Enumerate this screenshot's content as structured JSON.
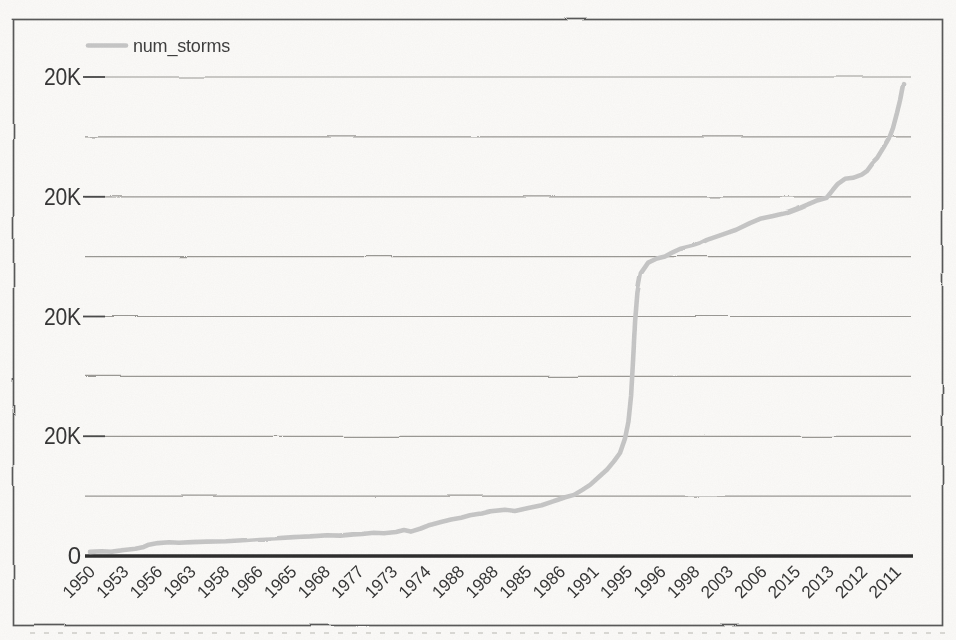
{
  "chart_data": {
    "type": "line",
    "title": "",
    "legend": {
      "position": "top-left",
      "entries": [
        {
          "label": "num_storms",
          "swatch": "thick-gray-line-segment"
        }
      ]
    },
    "x_axis": {
      "tick_labels": [
        "1950",
        "1953",
        "1956",
        "1963",
        "1958",
        "1966",
        "1965",
        "1968",
        "1977",
        "1973",
        "1974",
        "1988",
        "1988",
        "1985",
        "1986",
        "1991",
        "1995",
        "1996",
        "1998",
        "2003",
        "2006",
        "2015",
        "2013",
        "2012",
        "2011"
      ],
      "rotation_deg": -45
    },
    "y_axis": {
      "tick_labels_top_to_bottom": [
        "20K",
        "20K",
        "20K",
        "20K"
      ],
      "zero_label": "0",
      "note_as_printed": "every labeled gridline reads 20K",
      "internal_scale_top_gridline": 20,
      "minor_gridlines_between_labels": true
    },
    "grid": true,
    "series": [
      {
        "name": "num_storms",
        "points": [
          [
            0.15,
            0.17
          ],
          [
            0.5,
            0.2
          ],
          [
            0.8,
            0.18
          ],
          [
            1.16,
            0.25
          ],
          [
            1.5,
            0.3
          ],
          [
            1.75,
            0.38
          ],
          [
            1.9,
            0.47
          ],
          [
            2.17,
            0.54
          ],
          [
            2.5,
            0.57
          ],
          [
            2.8,
            0.55
          ],
          [
            3.19,
            0.58
          ],
          [
            3.6,
            0.6
          ],
          [
            4.2,
            0.62
          ],
          [
            4.7,
            0.66
          ],
          [
            5.21,
            0.71
          ],
          [
            5.7,
            0.74
          ],
          [
            6.22,
            0.79
          ],
          [
            6.7,
            0.82
          ],
          [
            7.24,
            0.87
          ],
          [
            7.6,
            0.85
          ],
          [
            8.0,
            0.9
          ],
          [
            8.25,
            0.92
          ],
          [
            8.6,
            0.97
          ],
          [
            8.9,
            0.95
          ],
          [
            9.26,
            1.0
          ],
          [
            9.5,
            1.08
          ],
          [
            9.7,
            1.02
          ],
          [
            10.0,
            1.15
          ],
          [
            10.27,
            1.3
          ],
          [
            10.6,
            1.42
          ],
          [
            10.9,
            1.52
          ],
          [
            11.2,
            1.6
          ],
          [
            11.46,
            1.7
          ],
          [
            11.79,
            1.78
          ],
          [
            12.06,
            1.87
          ],
          [
            12.5,
            1.93
          ],
          [
            12.8,
            1.88
          ],
          [
            13.2,
            2.0
          ],
          [
            13.6,
            2.12
          ],
          [
            14.06,
            2.34
          ],
          [
            14.3,
            2.45
          ],
          [
            14.56,
            2.55
          ],
          [
            14.8,
            2.75
          ],
          [
            15.04,
            2.97
          ],
          [
            15.3,
            3.3
          ],
          [
            15.54,
            3.6
          ],
          [
            15.75,
            3.95
          ],
          [
            15.93,
            4.3
          ],
          [
            16.08,
            4.9
          ],
          [
            16.18,
            5.6
          ],
          [
            16.26,
            6.7
          ],
          [
            16.32,
            8.2
          ],
          [
            16.38,
            9.8
          ],
          [
            16.45,
            11.0
          ],
          [
            16.55,
            11.8
          ],
          [
            16.77,
            12.25
          ],
          [
            17.03,
            12.42
          ],
          [
            17.27,
            12.5
          ],
          [
            17.5,
            12.68
          ],
          [
            17.71,
            12.82
          ],
          [
            18.1,
            12.95
          ],
          [
            18.3,
            13.05
          ],
          [
            18.52,
            13.2
          ],
          [
            19.06,
            13.46
          ],
          [
            19.39,
            13.62
          ],
          [
            19.8,
            13.9
          ],
          [
            20.1,
            14.08
          ],
          [
            20.49,
            14.2
          ],
          [
            20.9,
            14.33
          ],
          [
            21.29,
            14.54
          ],
          [
            21.77,
            14.83
          ],
          [
            22.09,
            14.96
          ],
          [
            22.27,
            15.29
          ],
          [
            22.42,
            15.54
          ],
          [
            22.63,
            15.75
          ],
          [
            22.87,
            15.79
          ],
          [
            23.13,
            15.92
          ],
          [
            23.29,
            16.08
          ],
          [
            23.44,
            16.37
          ],
          [
            23.59,
            16.58
          ],
          [
            23.77,
            17.0
          ],
          [
            23.94,
            17.42
          ],
          [
            24.06,
            17.87
          ],
          [
            24.18,
            18.5
          ],
          [
            24.27,
            19.04
          ],
          [
            24.36,
            19.7
          ]
        ]
      }
    ]
  },
  "colors": {
    "line": "#c6c6c6",
    "gridline": "#8f8d89",
    "tick": "#4a4a4a",
    "axis": "#2c2c2c",
    "label": "#353535",
    "legend_text": "#3d3d3d",
    "frame": "#585858",
    "paper": "#fbfaf8",
    "artifact": "#b9b7b2"
  }
}
